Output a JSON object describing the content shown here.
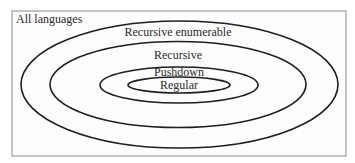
{
  "diagram": {
    "outer_label": "All languages",
    "sets": [
      {
        "id": "recursive-enumerable",
        "label": "Recursive enumerable"
      },
      {
        "id": "recursive",
        "label": "Recursive"
      },
      {
        "id": "pushdown",
        "label": "Pushdown"
      },
      {
        "id": "regular",
        "label": "Regular"
      }
    ],
    "colors": {
      "stroke": "#1e1e1e",
      "border": "#8a8a8a",
      "text": "#2a2a2a",
      "background": "#ffffff"
    }
  }
}
